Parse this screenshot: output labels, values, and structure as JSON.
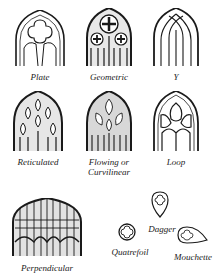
{
  "diagram": {
    "items": [
      {
        "id": "plate",
        "label": "Plate"
      },
      {
        "id": "geometric",
        "label": "Geometric"
      },
      {
        "id": "y",
        "label": "Y"
      },
      {
        "id": "reticulated",
        "label": "Reticulated"
      },
      {
        "id": "flowing",
        "label": "Flowing or",
        "label2": "Curvilinear"
      },
      {
        "id": "loop",
        "label": "Loop"
      },
      {
        "id": "perpendicular",
        "label": "Perpendicular"
      },
      {
        "id": "dagger",
        "label": "Dagger"
      },
      {
        "id": "quatrefoil",
        "label": "Quatrefoil"
      },
      {
        "id": "mouchette",
        "label": "Mouchette"
      }
    ],
    "colors": {
      "ink": "#1a1a1a",
      "background": "#ffffff"
    }
  }
}
